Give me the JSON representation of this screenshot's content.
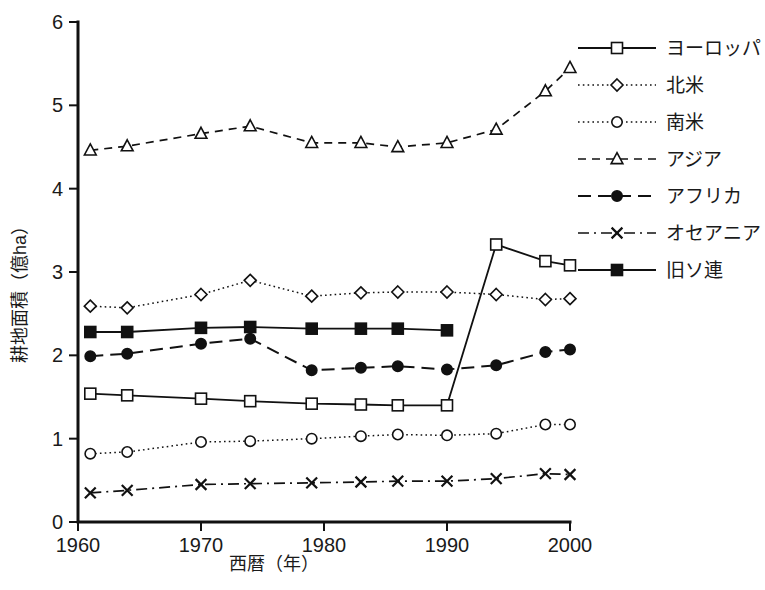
{
  "chart_data": {
    "type": "line",
    "title": "",
    "xlabel": "西暦（年）",
    "ylabel": "耕地面積（億ha）",
    "xlim": [
      1960,
      2000
    ],
    "ylim": [
      0,
      6
    ],
    "xticks": [
      1960,
      1970,
      1980,
      1990,
      2000
    ],
    "xtick_labels": [
      "1960",
      "1970",
      "1980",
      "1990",
      "2000"
    ],
    "yticks": [
      0,
      1,
      2,
      3,
      4,
      5,
      6
    ],
    "ytick_labels": [
      "0",
      "1",
      "2",
      "3",
      "4",
      "5",
      "6"
    ],
    "grid": false,
    "legend_position": "right",
    "x": [
      1961,
      1964,
      1970,
      1974,
      1979,
      1983,
      1986,
      1990,
      1994,
      1998,
      2000
    ],
    "series": [
      {
        "name": "ヨーロッパ",
        "marker": "open-square",
        "linestyle": "solid",
        "x": [
          1961,
          1964,
          1970,
          1974,
          1979,
          1983,
          1986,
          1990,
          1994,
          1998,
          2000
        ],
        "values": [
          1.54,
          1.52,
          1.48,
          1.45,
          1.42,
          1.41,
          1.4,
          1.4,
          3.33,
          3.13,
          3.08
        ]
      },
      {
        "name": "北米",
        "marker": "open-diamond",
        "linestyle": "dotted",
        "x": [
          1961,
          1964,
          1970,
          1974,
          1979,
          1983,
          1986,
          1990,
          1994,
          1998,
          2000
        ],
        "values": [
          2.59,
          2.57,
          2.73,
          2.9,
          2.71,
          2.75,
          2.76,
          2.76,
          2.73,
          2.67,
          2.68
        ]
      },
      {
        "name": "南米",
        "marker": "open-circle",
        "linestyle": "dotted",
        "x": [
          1961,
          1964,
          1970,
          1974,
          1979,
          1983,
          1986,
          1990,
          1994,
          1998,
          2000
        ],
        "values": [
          0.82,
          0.84,
          0.96,
          0.97,
          1.0,
          1.03,
          1.05,
          1.04,
          1.06,
          1.17,
          1.17
        ]
      },
      {
        "name": "アジア",
        "marker": "open-triangle",
        "linestyle": "dashed",
        "x": [
          1961,
          1964,
          1970,
          1974,
          1979,
          1983,
          1986,
          1990,
          1994,
          1998,
          2000
        ],
        "values": [
          4.46,
          4.51,
          4.66,
          4.75,
          4.55,
          4.55,
          4.5,
          4.55,
          4.71,
          5.17,
          5.45
        ]
      },
      {
        "name": "アフリカ",
        "marker": "filled-circle",
        "linestyle": "long-dash",
        "x": [
          1961,
          1964,
          1970,
          1974,
          1979,
          1983,
          1986,
          1990,
          1994,
          1998,
          2000
        ],
        "values": [
          1.99,
          2.02,
          2.14,
          2.2,
          1.82,
          1.85,
          1.87,
          1.83,
          1.88,
          2.04,
          2.07
        ]
      },
      {
        "name": "オセアニア",
        "marker": "cross-x",
        "linestyle": "dash-dot",
        "x": [
          1961,
          1964,
          1970,
          1974,
          1979,
          1983,
          1986,
          1990,
          1994,
          1998,
          2000
        ],
        "values": [
          0.35,
          0.38,
          0.45,
          0.46,
          0.47,
          0.48,
          0.49,
          0.49,
          0.52,
          0.58,
          0.57
        ]
      },
      {
        "name": "旧ソ連",
        "marker": "filled-square",
        "linestyle": "solid",
        "x": [
          1961,
          1964,
          1970,
          1974,
          1979,
          1983,
          1986,
          1990
        ],
        "values": [
          2.28,
          2.28,
          2.33,
          2.34,
          2.32,
          2.32,
          2.32,
          2.3
        ]
      }
    ]
  },
  "legend": {
    "items": [
      {
        "label": "ヨーロッパ"
      },
      {
        "label": "北米"
      },
      {
        "label": "南米"
      },
      {
        "label": "アジア"
      },
      {
        "label": "アフリカ"
      },
      {
        "label": "オセアニア"
      },
      {
        "label": "旧ソ連"
      }
    ]
  },
  "axes": {
    "x_title": "西暦（年）",
    "y_title": "耕地面積（億ha）"
  }
}
